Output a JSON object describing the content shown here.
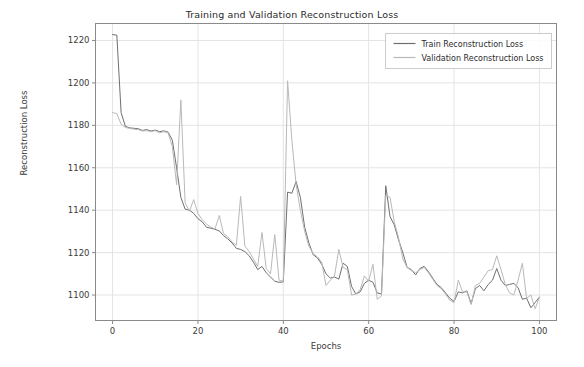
{
  "chart_data": {
    "type": "line",
    "title": "Training and Validation Reconstruction Loss",
    "xlabel": "Epochs",
    "ylabel": "Reconstruction Loss",
    "xlim": [
      -4,
      104
    ],
    "ylim": [
      1088,
      1228
    ],
    "xticks": [
      0,
      20,
      40,
      60,
      80,
      100
    ],
    "yticks": [
      1100,
      1120,
      1140,
      1160,
      1180,
      1200,
      1220
    ],
    "xtick_labels": [
      "0",
      "20",
      "40",
      "60",
      "80",
      "100"
    ],
    "ytick_labels": [
      "1100",
      "1120",
      "1140",
      "1160",
      "1180",
      "1200",
      "1220"
    ],
    "grid": true,
    "legend_position": "upper right",
    "colors": {
      "train": "#6f6f6f",
      "validation": "#b9b9b9",
      "grid": "#e4e4e4",
      "axis": "#8a8a8a",
      "text": "#3a3a3a"
    },
    "x": [
      0,
      1,
      2,
      3,
      4,
      5,
      6,
      7,
      8,
      9,
      10,
      11,
      12,
      13,
      14,
      15,
      16,
      17,
      18,
      19,
      20,
      21,
      22,
      23,
      24,
      25,
      26,
      27,
      28,
      29,
      30,
      31,
      32,
      33,
      34,
      35,
      36,
      37,
      38,
      39,
      40,
      41,
      42,
      43,
      44,
      45,
      46,
      47,
      48,
      49,
      50,
      51,
      52,
      53,
      54,
      55,
      56,
      57,
      58,
      59,
      60,
      61,
      62,
      63,
      64,
      65,
      66,
      67,
      68,
      69,
      70,
      71,
      72,
      73,
      74,
      75,
      76,
      77,
      78,
      79,
      80,
      81,
      82,
      83,
      84,
      85,
      86,
      87,
      88,
      89,
      90,
      91,
      92,
      93,
      94,
      95,
      96,
      97,
      98,
      99,
      100
    ],
    "series": [
      {
        "name": "Train Reconstruction Loss",
        "color": "#6f6f6f",
        "values": [
          1222.8,
          1222.5,
          1186.0,
          1179.5,
          1178.8,
          1178.6,
          1178.4,
          1177.6,
          1178.0,
          1177.3,
          1177.8,
          1177.0,
          1177.4,
          1176.8,
          1173.0,
          1160.0,
          1146.0,
          1140.5,
          1140.0,
          1138.5,
          1136.0,
          1134.5,
          1132.0,
          1131.5,
          1131.0,
          1130.2,
          1128.0,
          1126.5,
          1124.5,
          1122.0,
          1121.5,
          1120.5,
          1118.5,
          1115.5,
          1112.0,
          1113.5,
          1110.5,
          1108.5,
          1106.5,
          1106.0,
          1106.2,
          1148.5,
          1148.0,
          1153.5,
          1146.0,
          1132.0,
          1124.5,
          1119.0,
          1117.5,
          1114.5,
          1110.0,
          1108.0,
          1108.5,
          1107.5,
          1115.0,
          1113.5,
          1104.0,
          1100.5,
          1101.5,
          1105.5,
          1107.0,
          1106.0,
          1101.0,
          1100.5,
          1151.5,
          1137.0,
          1133.0,
          1126.0,
          1120.0,
          1113.0,
          1112.0,
          1109.5,
          1112.5,
          1113.5,
          1111.0,
          1108.0,
          1105.0,
          1103.5,
          1101.0,
          1098.5,
          1097.0,
          1101.5,
          1101.0,
          1102.0,
          1096.0,
          1103.0,
          1104.5,
          1102.0,
          1105.0,
          1107.0,
          1112.5,
          1107.0,
          1104.5,
          1105.0,
          1105.5,
          1103.5,
          1098.0,
          1098.5,
          1094.0,
          1096.5,
          1099.0
        ]
      },
      {
        "name": "Validation Reconstruction Loss",
        "color": "#b9b9b9",
        "values": [
          1186.0,
          1185.5,
          1180.5,
          1179.0,
          1178.5,
          1178.2,
          1178.0,
          1177.3,
          1177.5,
          1177.0,
          1177.5,
          1176.5,
          1177.0,
          1176.5,
          1170.0,
          1152.0,
          1192.0,
          1143.5,
          1139.5,
          1145.0,
          1138.5,
          1135.5,
          1133.5,
          1132.0,
          1131.2,
          1137.5,
          1129.0,
          1127.5,
          1125.0,
          1123.5,
          1146.5,
          1123.0,
          1120.5,
          1117.0,
          1113.5,
          1129.5,
          1112.5,
          1110.0,
          1128.5,
          1107.0,
          1106.5,
          1201.0,
          1173.0,
          1152.0,
          1140.0,
          1130.0,
          1123.0,
          1119.5,
          1118.0,
          1115.5,
          1104.5,
          1107.0,
          1109.0,
          1121.5,
          1113.0,
          1112.0,
          1100.0,
          1100.5,
          1102.5,
          1109.0,
          1106.5,
          1114.5,
          1098.0,
          1099.5,
          1147.0,
          1146.0,
          1134.5,
          1127.0,
          1117.0,
          1113.0,
          1111.5,
          1110.5,
          1112.0,
          1113.0,
          1110.5,
          1107.5,
          1104.5,
          1103.0,
          1100.5,
          1097.5,
          1096.5,
          1107.0,
          1101.5,
          1101.5,
          1095.5,
          1104.5,
          1105.5,
          1108.5,
          1111.5,
          1112.0,
          1118.5,
          1112.0,
          1105.0,
          1101.0,
          1100.0,
          1107.0,
          1115.0,
          1098.5,
          1100.0,
          1093.5,
          1099.0
        ]
      }
    ]
  },
  "legend": {
    "entries": [
      {
        "label": "Train Reconstruction Loss"
      },
      {
        "label": "Validation Reconstruction Loss"
      }
    ]
  }
}
